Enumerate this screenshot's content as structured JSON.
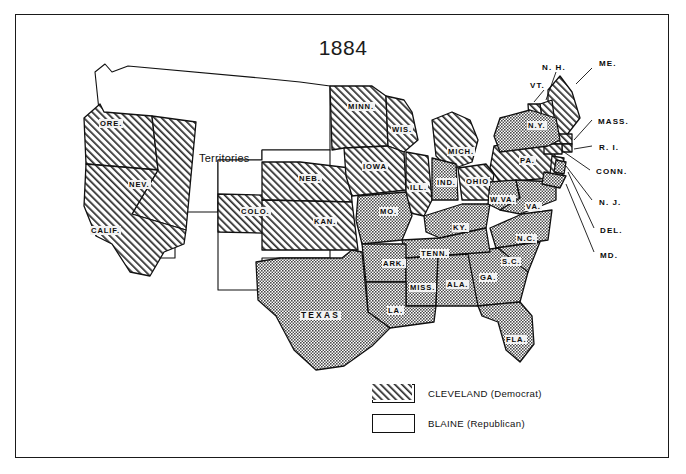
{
  "map": {
    "title": "1884",
    "territories_label": "Territories",
    "legend": [
      {
        "label": "CLEVELAND  (Democrat)",
        "pattern": "stipple",
        "party": "Democrat",
        "candidate": "CLEVELAND"
      },
      {
        "label": "BLAINE  (Republican)",
        "pattern": "hatch",
        "party": "Republican",
        "candidate": "BLAINE"
      }
    ],
    "colors": {
      "ink": "#111111",
      "stipple_fill": "#8d8d8d",
      "hatch_fill": "#ffffff",
      "unfilled": "#ffffff"
    },
    "states": [
      {
        "code": "ORE.",
        "label": "ORE.",
        "winner": "BLAINE",
        "pattern": "hatch",
        "x": 109,
        "y": 124
      },
      {
        "code": "NEV.",
        "label": "NEV.",
        "winner": "BLAINE",
        "pattern": "hatch",
        "x": 136,
        "y": 185
      },
      {
        "code": "CALIF.",
        "label": "CALIF.",
        "winner": "BLAINE",
        "pattern": "hatch",
        "x": 98,
        "y": 231
      },
      {
        "code": "COLO.",
        "label": "COLO.",
        "winner": "BLAINE",
        "pattern": "hatch",
        "x": 248,
        "y": 212
      },
      {
        "code": "NEB.",
        "label": "NEB.",
        "winner": "BLAINE",
        "pattern": "hatch",
        "x": 306,
        "y": 179
      },
      {
        "code": "KAN.",
        "label": "KAN.",
        "winner": "BLAINE",
        "pattern": "hatch",
        "x": 321,
        "y": 222
      },
      {
        "code": "MINN.",
        "label": "MINN.",
        "winner": "BLAINE",
        "pattern": "hatch",
        "x": 355,
        "y": 107
      },
      {
        "code": "WIS.",
        "label": "WIS.",
        "winner": "BLAINE",
        "pattern": "hatch",
        "x": 398,
        "y": 130
      },
      {
        "code": "IOWA",
        "label": "IOWA",
        "winner": "BLAINE",
        "pattern": "hatch",
        "x": 371,
        "y": 167
      },
      {
        "code": "ILL.",
        "label": "ILL.",
        "winner": "BLAINE",
        "pattern": "hatch",
        "x": 415,
        "y": 188
      },
      {
        "code": "MICH.",
        "label": "MICH.",
        "winner": "BLAINE",
        "pattern": "hatch",
        "x": 455,
        "y": 152
      },
      {
        "code": "OHIO",
        "label": "OHIO",
        "winner": "BLAINE",
        "pattern": "hatch",
        "x": 472,
        "y": 182
      },
      {
        "code": "PA.",
        "label": "PA.",
        "winner": "BLAINE",
        "pattern": "hatch",
        "x": 524,
        "y": 161
      },
      {
        "code": "MO.",
        "label": "MO.",
        "winner": "CLEVELAND",
        "pattern": "stipple",
        "x": 385,
        "y": 212
      },
      {
        "code": "IND.",
        "label": "IND.",
        "winner": "CLEVELAND",
        "pattern": "stipple",
        "x": 443,
        "y": 183
      },
      {
        "code": "KY.",
        "label": "KY.",
        "winner": "CLEVELAND",
        "pattern": "stipple",
        "x": 457,
        "y": 228
      },
      {
        "code": "W.VA.",
        "label": "W.VA.",
        "winner": "CLEVELAND",
        "pattern": "stipple",
        "x": 497,
        "y": 200
      },
      {
        "code": "VA.",
        "label": "VA.",
        "winner": "CLEVELAND",
        "pattern": "stipple",
        "x": 530,
        "y": 207
      },
      {
        "code": "N.C.",
        "label": "N.C.",
        "winner": "CLEVELAND",
        "pattern": "stipple",
        "x": 523,
        "y": 239
      },
      {
        "code": "S.C.",
        "label": "S.C.",
        "winner": "CLEVELAND",
        "pattern": "stipple",
        "x": 508,
        "y": 262
      },
      {
        "code": "GA.",
        "label": "GA.",
        "winner": "CLEVELAND",
        "pattern": "stipple",
        "x": 485,
        "y": 278
      },
      {
        "code": "TENN.",
        "label": "TENN.",
        "winner": "CLEVELAND",
        "pattern": "stipple",
        "x": 428,
        "y": 254
      },
      {
        "code": "ARK.",
        "label": "ARK.",
        "winner": "CLEVELAND",
        "pattern": "stipple",
        "x": 389,
        "y": 264
      },
      {
        "code": "MISS.",
        "label": "MISS.",
        "winner": "CLEVELAND",
        "pattern": "stipple",
        "x": 416,
        "y": 288
      },
      {
        "code": "ALA.",
        "label": "ALA.",
        "winner": "CLEVELAND",
        "pattern": "stipple",
        "x": 452,
        "y": 285
      },
      {
        "code": "LA.",
        "label": "LA.",
        "winner": "CLEVELAND",
        "pattern": "stipple",
        "x": 392,
        "y": 311
      },
      {
        "code": "TEXAS",
        "label": "TEXAS",
        "winner": "CLEVELAND",
        "pattern": "stipple",
        "x": 310,
        "y": 317
      },
      {
        "code": "FLA.",
        "label": "FLA.",
        "winner": "CLEVELAND",
        "pattern": "stipple",
        "x": 511,
        "y": 340
      },
      {
        "code": "N.Y.",
        "label": "N.Y.",
        "winner": "CLEVELAND",
        "pattern": "stipple",
        "x": 534,
        "y": 126
      }
    ],
    "callout_states": [
      {
        "code": "N.H.",
        "label": "N. H.",
        "winner": "BLAINE",
        "x": 541,
        "y": 68
      },
      {
        "code": "ME.",
        "label": "ME.",
        "winner": "BLAINE",
        "x": 598,
        "y": 64
      },
      {
        "code": "VT.",
        "label": "VT.",
        "winner": "BLAINE",
        "x": 529,
        "y": 86
      },
      {
        "code": "MASS.",
        "label": "MASS.",
        "winner": "BLAINE",
        "x": 597,
        "y": 122
      },
      {
        "code": "R.I.",
        "label": "R. I.",
        "winner": "BLAINE",
        "x": 598,
        "y": 148
      },
      {
        "code": "CONN.",
        "label": "CONN.",
        "winner": "BLAINE",
        "x": 595,
        "y": 172
      },
      {
        "code": "N.J.",
        "label": "N. J.",
        "winner": "BLAINE",
        "x": 598,
        "y": 203
      },
      {
        "code": "DEL.",
        "label": "DEL.",
        "winner": "CLEVELAND",
        "x": 599,
        "y": 231
      },
      {
        "code": "MD.",
        "label": "MD.",
        "winner": "CLEVELAND",
        "x": 599,
        "y": 256
      }
    ]
  }
}
